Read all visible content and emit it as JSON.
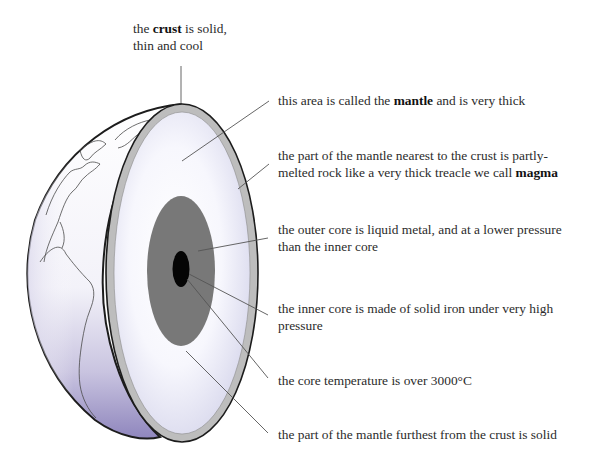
{
  "diagram": {
    "colors": {
      "crust": "#b9b9b9",
      "crust_edge": "#2a2a2a",
      "mantle_center": "#ffffff",
      "mantle_edge": "#d8d8ee",
      "outer_core": "#7a7a7a",
      "inner_core": "#050505",
      "globe_surface": "#ffffff",
      "globe_shade": "#9f97c6",
      "leader_line": "#555555"
    },
    "labels": [
      {
        "id": "crust",
        "pre": "the ",
        "bold": "crust",
        "post": " is solid,",
        "line2": "thin and cool"
      },
      {
        "id": "mantle",
        "pre": "this area is called the ",
        "bold": "mantle",
        "post": " and is very thick",
        "line2": ""
      },
      {
        "id": "magma",
        "pre": "the part of the mantle nearest to the crust is partly-",
        "bold": "",
        "post": "",
        "line2_pre": "melted rock like a very thick treacle we call ",
        "line2_bold": "magma"
      },
      {
        "id": "outer-core",
        "pre": "the outer core is liquid metal, and at a lower pressure",
        "bold": "",
        "post": "",
        "line2": "than the inner core"
      },
      {
        "id": "inner-core",
        "pre": "the inner core is made of solid iron under very high",
        "bold": "",
        "post": "",
        "line2": "pressure"
      },
      {
        "id": "core-temperature",
        "pre": "the core temperature is over 3000°C",
        "bold": "",
        "post": "",
        "line2": ""
      },
      {
        "id": "lower-mantle",
        "pre": "the part of the mantle furthest from the crust is solid",
        "bold": "",
        "post": "",
        "line2": ""
      }
    ]
  }
}
